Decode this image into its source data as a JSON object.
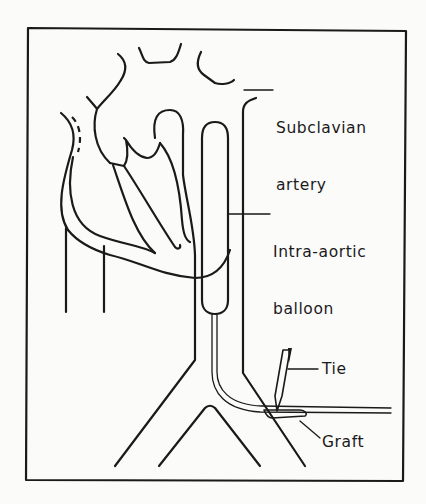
{
  "figure": {
    "labels": {
      "subclavian": [
        "Subclavian",
        "artery"
      ],
      "balloon": [
        "Intra-aortic",
        "balloon"
      ],
      "tie": "Tie",
      "graft": "Graft"
    }
  }
}
